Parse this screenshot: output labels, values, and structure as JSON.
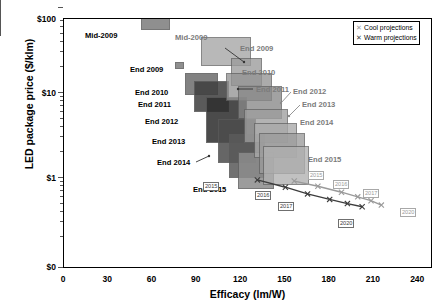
{
  "chart_data": {
    "type": "scatter",
    "title": "",
    "xlabel": "Efficacy (lm/W)",
    "ylabel": "LED package price ($/klm)",
    "xlim": [
      0,
      250
    ],
    "ylim": [
      0.3,
      100
    ],
    "yscale": "log",
    "grid": false,
    "xticks": [
      "0",
      "30",
      "60",
      "90",
      "120",
      "150",
      "180",
      "210",
      "240"
    ],
    "yticks": [
      "$100",
      "$10",
      "$1",
      "$0"
    ],
    "legend": {
      "position": "top-right",
      "entries": [
        {
          "label": "Cool projections",
          "marker": "x",
          "color": "#9a9a9a"
        },
        {
          "label": "Warm projections",
          "marker": "x",
          "color": "#3d3d3d"
        }
      ]
    },
    "boxes": [
      {
        "label": "Mid-2009",
        "series": "warm",
        "x0": 52,
        "x1": 72,
        "y0": 55,
        "y1": 90,
        "color": "#7d7d7d"
      },
      {
        "label": "End 2009",
        "series": "warm",
        "x0": 75,
        "x1": 81,
        "y0": 19,
        "y1": 23,
        "color": "#7d7d7d"
      },
      {
        "label": "End 2010",
        "series": "warm",
        "x0": 82,
        "x1": 104,
        "y0": 9.5,
        "y1": 17,
        "color": "#6e6e6e"
      },
      {
        "label": "End 2011",
        "series": "warm",
        "x0": 88,
        "x1": 112,
        "y0": 6.0,
        "y1": 14,
        "color": "#3f3f3f"
      },
      {
        "label": "End 2012",
        "series": "warm",
        "x0": 96,
        "x1": 124,
        "y0": 2.6,
        "y1": 9.0,
        "color": "#2e2e2e"
      },
      {
        "label": "End 2013",
        "series": "warm",
        "x0": 104,
        "x1": 130,
        "y0": 1.5,
        "y1": 5.0,
        "color": "#4d4d4d"
      },
      {
        "label": "End 2014",
        "series": "warm",
        "x0": 112,
        "x1": 136,
        "y0": 1.0,
        "y1": 3.3,
        "color": "#5a5a5a"
      },
      {
        "label": "End 2015",
        "series": "warm",
        "x0": 118,
        "x1": 142,
        "y0": 0.75,
        "y1": 2.0,
        "color": "#8c8c8c"
      },
      {
        "label": "Mid-2009",
        "series": "cool",
        "x0": 93,
        "x1": 127,
        "y0": 21,
        "y1": 45,
        "color": "#a5a5a5"
      },
      {
        "label": "End 2009",
        "series": "cool",
        "x0": 113,
        "x1": 134,
        "y0": 12,
        "y1": 26,
        "color": "#9b9b9b"
      },
      {
        "label": "End 2010",
        "series": "cool",
        "x0": 110,
        "x1": 141,
        "y0": 8.0,
        "y1": 17,
        "color": "#949494"
      },
      {
        "label": "End 2011",
        "series": "cool",
        "x0": 118,
        "x1": 148,
        "y0": 5.0,
        "y1": 12,
        "color": "#888888"
      },
      {
        "label": "End 2012",
        "series": "cool",
        "x0": 122,
        "x1": 152,
        "y0": 2.6,
        "y1": 6.5,
        "color": "#9e9e9e"
      },
      {
        "label": "End 2013",
        "series": "cool",
        "x0": 129,
        "x1": 158,
        "y0": 1.7,
        "y1": 4.4,
        "color": "#a9a9a9"
      },
      {
        "label": "End 2014",
        "series": "cool",
        "x0": 132,
        "x1": 163,
        "y0": 1.1,
        "y1": 3.4,
        "color": "#9c9c9c"
      },
      {
        "label": "End 2015",
        "series": "cool",
        "x0": 135,
        "x1": 166,
        "y0": 0.82,
        "y1": 2.4,
        "color": "#b0b0b0"
      }
    ],
    "projections": [
      {
        "name": "Warm projections",
        "color": "#3d3d3d",
        "points": [
          {
            "year": "2015",
            "x": 131,
            "y": 0.95
          },
          {
            "year": "2016",
            "x": 150,
            "y": 0.78
          },
          {
            "year": "2017",
            "x": 165,
            "y": 0.65
          },
          {
            "year": "2018",
            "x": 180,
            "y": 0.56
          },
          {
            "year": "2019",
            "x": 192,
            "y": 0.5
          },
          {
            "year": "2020",
            "x": 202,
            "y": 0.46
          }
        ],
        "tags": [
          "2015",
          "2016",
          "2017",
          "2020"
        ]
      },
      {
        "name": "Cool projections",
        "color": "#9a9a9a",
        "points": [
          {
            "year": "2015",
            "x": 156,
            "y": 0.92
          },
          {
            "year": "2016",
            "x": 172,
            "y": 0.8
          },
          {
            "year": "2017",
            "x": 188,
            "y": 0.68
          },
          {
            "year": "2018",
            "x": 199,
            "y": 0.6
          },
          {
            "year": "2019",
            "x": 208,
            "y": 0.54
          },
          {
            "year": "2020",
            "x": 215,
            "y": 0.48
          }
        ],
        "tags": [
          "2015",
          "2016",
          "2017",
          "2020"
        ]
      }
    ],
    "annotations": [
      {
        "text": "Mid-2009",
        "series": "warm",
        "x": 85,
        "y": 31
      },
      {
        "text": "End 2009",
        "series": "warm",
        "x": 130,
        "y": 65
      },
      {
        "text": "End 2010",
        "series": "warm",
        "x": 135,
        "y": 88
      },
      {
        "text": "End 2011",
        "series": "warm",
        "x": 138,
        "y": 100
      },
      {
        "text": "End 2012",
        "series": "warm",
        "x": 145,
        "y": 117
      },
      {
        "text": "End 2013",
        "series": "warm",
        "x": 152,
        "y": 137
      },
      {
        "text": "End 2014",
        "series": "warm",
        "x": 157,
        "y": 158
      },
      {
        "text": "End 2015",
        "series": "warm",
        "x": 193,
        "y": 185
      },
      {
        "text": "Mid-2009",
        "series": "cool",
        "x": 175,
        "y": 33
      },
      {
        "text": "End 2009",
        "series": "cool",
        "x": 240,
        "y": 44
      },
      {
        "text": "End 2010",
        "series": "cool",
        "x": 242,
        "y": 68
      },
      {
        "text": "End 2011",
        "series": "cool",
        "x": 256,
        "y": 85
      },
      {
        "text": "End 2012",
        "series": "cool",
        "x": 293,
        "y": 87
      },
      {
        "text": "End 2013",
        "series": "cool",
        "x": 302,
        "y": 100
      },
      {
        "text": "End 2014",
        "series": "cool",
        "x": 300,
        "y": 118
      },
      {
        "text": "End 2015",
        "series": "cool",
        "x": 308,
        "y": 155
      }
    ]
  }
}
